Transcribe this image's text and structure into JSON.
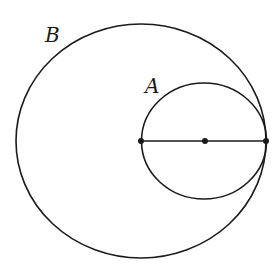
{
  "diagram": {
    "labels": {
      "outer_circle": "B",
      "inner_circle": "A"
    },
    "colors": {
      "stroke": "#1a1a1a",
      "background": "#ffffff"
    }
  }
}
